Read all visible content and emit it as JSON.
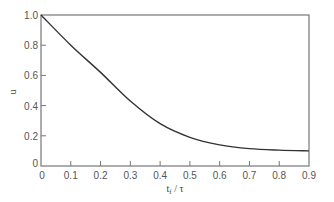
{
  "chart_data": {
    "type": "line",
    "title": "",
    "xlabel": "t_f / τ",
    "ylabel": "u",
    "xlim": [
      0,
      0.9
    ],
    "ylim": [
      0,
      1.0
    ],
    "grid": false,
    "legend": null,
    "x_ticks": [
      "0",
      "0.1",
      "0.2",
      "0.3",
      "0.4",
      "0.5",
      "0.6",
      "0.7",
      "0.8",
      "0.9"
    ],
    "y_ticks": [
      "0",
      "0.2",
      "0.4",
      "0.6",
      "0.8",
      "1.0"
    ],
    "series": [
      {
        "name": "u",
        "x": [
          0,
          0.1,
          0.2,
          0.3,
          0.4,
          0.5,
          0.6,
          0.7,
          0.8,
          0.9
        ],
        "values": [
          1.0,
          0.8,
          0.62,
          0.43,
          0.28,
          0.19,
          0.14,
          0.115,
          0.105,
          0.1
        ]
      }
    ],
    "colors": {
      "line": "#333333",
      "axis": "#777777",
      "text": "#555555"
    }
  },
  "labels": {
    "x_axis": "t",
    "x_axis_sub": "f",
    "x_axis_rest": " / τ",
    "y_axis": "u",
    "origin_y": "0"
  }
}
